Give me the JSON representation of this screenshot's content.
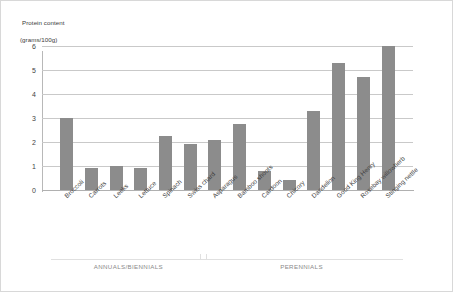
{
  "chart_data": {
    "type": "bar",
    "title": "",
    "ylabel": "Protein content (grams/100g)",
    "ylabel_line1": "Protein content",
    "ylabel_line2": "(grams/100g)",
    "xlabel": "",
    "ylim": [
      0,
      6.5
    ],
    "yticks": [
      0,
      1,
      2,
      3,
      4,
      5,
      6
    ],
    "ytick_labels": [
      "0",
      "1",
      "2",
      "3",
      "4",
      "5",
      "6"
    ],
    "grid": true,
    "legend": "none",
    "bar_color": "#8c8c8c",
    "gridline_color": "#c9c9c9",
    "categories": [
      "Broccoli",
      "Carrots",
      "Leeks",
      "Lettuce",
      "Spinach",
      "Swiss chard",
      "Asparagus",
      "Bamboo shoots",
      "Cardoon",
      "Chicory",
      "Dandelion",
      "Good King Henry",
      "Rosebay willowherb",
      "Stinging nettle"
    ],
    "values": [
      3.0,
      0.9,
      1.0,
      0.9,
      2.25,
      1.9,
      2.1,
      2.75,
      0.8,
      0.4,
      3.3,
      5.3,
      4.7,
      6.0
    ],
    "groups": [
      {
        "label": "ANNUALS/BIENNIALS",
        "start_index": 0,
        "end_index": 5
      },
      {
        "label": "PERENNIALS",
        "start_index": 6,
        "end_index": 13
      }
    ]
  }
}
